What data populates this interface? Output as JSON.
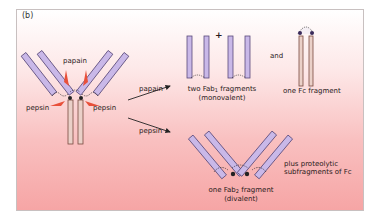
{
  "panel_label": "(b)",
  "diagram": {
    "intact_antibody_labels": {
      "papain_top": "papain",
      "pepsin_left": "pepsin",
      "pepsin_right": "pepsin"
    },
    "arrows": {
      "upper": "papain",
      "lower": "pepsin"
    },
    "papain_products": {
      "plus_sign": "+",
      "fab_caption_line1_prefix": "two Fab",
      "fab_caption_line1_sub": "1",
      "fab_caption_line1_suffix": " fragments",
      "fab_caption_line2": "(monovalent)",
      "and_label": "and",
      "fc_caption": "one Fc fragment"
    },
    "pepsin_products": {
      "fab2_caption_line1_prefix": "one Fab",
      "fab2_caption_line1_sub": "2",
      "fab2_caption_line1_suffix": " fragment",
      "fab2_caption_line2": "(divalent)",
      "extra_line1": "plus proteolytic",
      "extra_line2": "subfragments of Fc"
    },
    "colors": {
      "heavy_light_chain_fill": "#c9b8e8",
      "chain_stroke": "#5a4a7a",
      "fc_fill": "#e8c8c0",
      "fc_stroke": "#7a4a40",
      "enzyme_arrow": "#e8503a",
      "reaction_arrow": "#222222",
      "background_top": "#ffffff",
      "background_bottom": "#f6a5a5"
    }
  }
}
